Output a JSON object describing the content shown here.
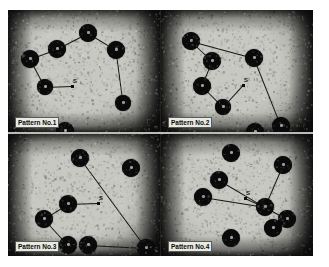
{
  "figure": {
    "kind": "photographic-plate",
    "caption_visible": false,
    "background_color": "#ffffff",
    "plate_color": "#1a1a1a",
    "panel_paper_color": "#c8c8c2",
    "node_color": "#0a0a0a",
    "edge_color": "#141414",
    "label_box_color": "#e9e9e4",
    "label_text_color": "#090909",
    "marker_letter": "S"
  },
  "panels": [
    {
      "id": "panel-1",
      "label": "Pattern No.1",
      "marker_label": "S",
      "nodes": [
        {
          "x": 22,
          "y": 49,
          "r": 9
        },
        {
          "x": 49,
          "y": 39,
          "r": 9
        },
        {
          "x": 80,
          "y": 23,
          "r": 9
        },
        {
          "x": 108,
          "y": 40,
          "r": 9
        },
        {
          "x": 37,
          "y": 77,
          "r": 8
        },
        {
          "x": 115,
          "y": 93,
          "r": 8
        },
        {
          "x": 57,
          "y": 121,
          "r": 9
        }
      ],
      "edges": [
        [
          0,
          1
        ],
        [
          1,
          2
        ],
        [
          2,
          3
        ],
        [
          0,
          4
        ],
        [
          3,
          5
        ]
      ],
      "marker": {
        "from_node": 4,
        "x": 64,
        "y": 76
      }
    },
    {
      "id": "panel-2",
      "label": "Pattern No.2",
      "marker_label": "S",
      "nodes": [
        {
          "x": 30,
          "y": 31,
          "r": 9
        },
        {
          "x": 51,
          "y": 51,
          "r": 9
        },
        {
          "x": 41,
          "y": 76,
          "r": 9
        },
        {
          "x": 62,
          "y": 97,
          "r": 8
        },
        {
          "x": 93,
          "y": 48,
          "r": 9
        },
        {
          "x": 120,
          "y": 116,
          "r": 9
        },
        {
          "x": 94,
          "y": 122,
          "r": 9
        }
      ],
      "edges": [
        [
          0,
          1
        ],
        [
          1,
          2
        ],
        [
          2,
          3
        ],
        [
          0,
          4
        ],
        [
          4,
          5
        ]
      ],
      "marker": {
        "from_node": 3,
        "x": 82,
        "y": 75
      }
    },
    {
      "id": "panel-3",
      "label": "Pattern No.3",
      "marker_label": "S",
      "nodes": [
        {
          "x": 72,
          "y": 24,
          "r": 9
        },
        {
          "x": 123,
          "y": 34,
          "r": 9
        },
        {
          "x": 60,
          "y": 70,
          "r": 9
        },
        {
          "x": 36,
          "y": 85,
          "r": 9
        },
        {
          "x": 60,
          "y": 111,
          "r": 9
        },
        {
          "x": 80,
          "y": 111,
          "r": 9
        },
        {
          "x": 138,
          "y": 114,
          "r": 9
        }
      ],
      "edges": [
        [
          0,
          6
        ],
        [
          2,
          3
        ],
        [
          3,
          4
        ],
        [
          5,
          6
        ]
      ],
      "marker": {
        "from_node": 2,
        "x": 90,
        "y": 69
      }
    },
    {
      "id": "panel-4",
      "label": "Pattern No.4",
      "marker_label": "S",
      "nodes": [
        {
          "x": 70,
          "y": 19,
          "r": 9
        },
        {
          "x": 58,
          "y": 46,
          "r": 9
        },
        {
          "x": 42,
          "y": 63,
          "r": 9
        },
        {
          "x": 122,
          "y": 31,
          "r": 9
        },
        {
          "x": 104,
          "y": 73,
          "r": 9
        },
        {
          "x": 126,
          "y": 85,
          "r": 9
        },
        {
          "x": 112,
          "y": 94,
          "r": 9
        },
        {
          "x": 70,
          "y": 104,
          "r": 9
        }
      ],
      "edges": [
        [
          1,
          4
        ],
        [
          2,
          4
        ],
        [
          3,
          4
        ],
        [
          4,
          5
        ]
      ],
      "marker": {
        "from_node": 4,
        "x": 84,
        "y": 64
      }
    }
  ]
}
